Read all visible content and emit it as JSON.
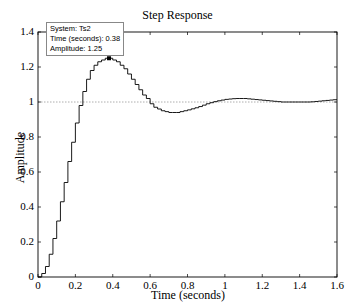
{
  "chart_data": {
    "type": "line",
    "title": "Step Response",
    "xlabel": "Time (seconds)",
    "ylabel": "Amplitude",
    "xlim": [
      0,
      1.6
    ],
    "ylim": [
      0,
      1.4
    ],
    "xticks": [
      "0",
      "0.2",
      "0.4",
      "0.6",
      "0.8",
      "1",
      "1.2",
      "1.4",
      "1.6"
    ],
    "yticks": [
      "0",
      "0.2",
      "0.4",
      "0.6",
      "0.8",
      "1",
      "1.2",
      "1.4"
    ],
    "grid": false,
    "reference_line": {
      "y": 1.0,
      "style": "dotted"
    },
    "series": [
      {
        "name": "Ts2",
        "style": "stairs",
        "sample_time": 0.02,
        "x": [
          0,
          0.02,
          0.04,
          0.06,
          0.08,
          0.1,
          0.12,
          0.14,
          0.16,
          0.18,
          0.2,
          0.22,
          0.24,
          0.26,
          0.28,
          0.3,
          0.32,
          0.34,
          0.36,
          0.38,
          0.4,
          0.42,
          0.44,
          0.46,
          0.48,
          0.5,
          0.52,
          0.54,
          0.56,
          0.58,
          0.6,
          0.62,
          0.64,
          0.66,
          0.68,
          0.7,
          0.72,
          0.74,
          0.76,
          0.78,
          0.8,
          0.85,
          0.9,
          0.95,
          1.0,
          1.05,
          1.1,
          1.15,
          1.2,
          1.25,
          1.3,
          1.35,
          1.4,
          1.45,
          1.5,
          1.55,
          1.6
        ],
        "values": [
          0,
          0.02,
          0.06,
          0.13,
          0.22,
          0.32,
          0.43,
          0.54,
          0.66,
          0.77,
          0.88,
          0.98,
          1.06,
          1.13,
          1.18,
          1.21,
          1.23,
          1.24,
          1.25,
          1.25,
          1.24,
          1.23,
          1.21,
          1.19,
          1.16,
          1.13,
          1.1,
          1.07,
          1.04,
          1.02,
          0.99,
          0.97,
          0.96,
          0.95,
          0.945,
          0.94,
          0.94,
          0.94,
          0.945,
          0.95,
          0.955,
          0.97,
          0.99,
          1.005,
          1.015,
          1.02,
          1.02,
          1.015,
          1.01,
          1.005,
          1.0,
          1.0,
          1.0,
          1.0,
          1.005,
          1.01,
          1.015
        ]
      }
    ],
    "datatip": {
      "x": 0.38,
      "y": 1.25,
      "lines": [
        "System: Ts2",
        "Time (seconds): 0.38",
        "Amplitude: 1.25"
      ]
    }
  }
}
